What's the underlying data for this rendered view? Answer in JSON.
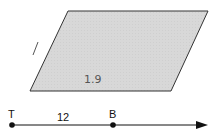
{
  "figure": {
    "shape": "parallelogram",
    "fill_color": "#d6d6d6",
    "stroke_color": "#333333",
    "handwritten_label": "1.9",
    "side_mark": "/"
  },
  "number_line": {
    "points": [
      {
        "label": "T"
      },
      {
        "label": "B"
      }
    ],
    "segment_label": "12",
    "line_color": "#111111"
  }
}
